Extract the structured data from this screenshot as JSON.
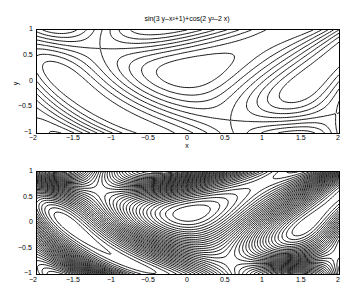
{
  "chart_data": [
    {
      "type": "contour",
      "title": "sin(3 y-x^2+1)+cos(2 y^2-2 x)",
      "xlabel": "x",
      "ylabel": "y",
      "xlim": [
        -2,
        2
      ],
      "ylim": [
        -1,
        1
      ],
      "xticks": [
        "-2",
        "-1.5",
        "-1",
        "-0.5",
        "0",
        "0.5",
        "1",
        "1.5",
        "2"
      ],
      "yticks": [
        "-1",
        "-0.5",
        "0",
        "0.5",
        "1"
      ],
      "function": "sin(3*y - x^2 + 1) + cos(2*y^2 - 2*x)",
      "levels": "default (~10)",
      "grid": false
    },
    {
      "type": "contour",
      "title": "",
      "xlabel": "",
      "ylabel": "",
      "xlim": [
        -2,
        2
      ],
      "ylim": [
        -1,
        1
      ],
      "xticks": [
        "-2",
        "-1.5",
        "-1",
        "-0.5",
        "0",
        "0.5",
        "1",
        "1.5",
        "2"
      ],
      "yticks": [
        "-1",
        "-0.5",
        "0",
        "0.5",
        "1"
      ],
      "function": "sin(3*y - x^2 + 1) + cos(2*y^2 - 2*x)",
      "levels": "dense (~40)",
      "grid": false
    }
  ],
  "labels": {
    "title": "sin(3 y–x²+1)+cos(2 y²–2 x)",
    "xlabel": "x",
    "ylabel": "y",
    "xticks": [
      "−2",
      "−1.5",
      "−1",
      "−0.5",
      "0",
      "0.5",
      "1",
      "1.5",
      "2"
    ],
    "yticks": [
      "1",
      "0.5",
      "0",
      "−0.5",
      "−1"
    ]
  }
}
